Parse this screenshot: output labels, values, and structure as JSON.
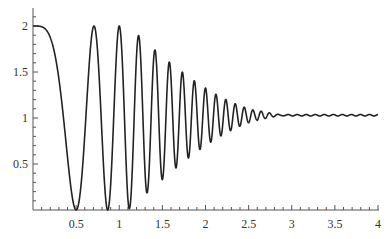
{
  "chart_data": {
    "type": "line",
    "title": "",
    "xlabel": "",
    "ylabel": "",
    "xlim": [
      0,
      4
    ],
    "ylim": [
      0,
      2.2
    ],
    "grid": false,
    "legend": null,
    "x_ticks": [
      0.5,
      1,
      1.5,
      2,
      2.5,
      3,
      3.5,
      4
    ],
    "x_tick_labels": [
      "0.5",
      "1",
      "1.5",
      "2",
      "2.5",
      "3",
      "3.5",
      "4"
    ],
    "y_ticks": [
      0.5,
      1,
      1.5,
      2
    ],
    "y_tick_labels": [
      "0.5",
      "1",
      "1.5",
      "2"
    ],
    "series": [
      {
        "name": "curve",
        "color": "#222222",
        "description": "1 + cos(4*pi*x^2) * envelope(x); envelope = 1 for x<=1.1, decaying smoothly to ~0 near x=3; settles near y=1.03",
        "params": {
          "freq": 12.566,
          "decay_start": 1.1,
          "decay_end": 3.0,
          "baseline": 1.0,
          "tail_offset": 0.03,
          "tail_ripple": 0.008
        },
        "key_points": [
          {
            "x": 0.0,
            "y": 2.0
          },
          {
            "x": 0.5,
            "y": 0.0
          },
          {
            "x": 0.707,
            "y": 2.0
          },
          {
            "x": 0.866,
            "y": 0.0
          },
          {
            "x": 1.0,
            "y": 2.0
          },
          {
            "x": 1.22,
            "y": 1.99
          },
          {
            "x": 1.41,
            "y": 1.92
          },
          {
            "x": 1.58,
            "y": 1.84
          },
          {
            "x": 1.72,
            "y": 1.73
          },
          {
            "x": 1.86,
            "y": 1.62
          },
          {
            "x": 1.99,
            "y": 1.52
          },
          {
            "x": 2.12,
            "y": 1.41
          },
          {
            "x": 2.23,
            "y": 1.33
          },
          {
            "x": 2.33,
            "y": 1.24
          },
          {
            "x": 2.44,
            "y": 1.16
          },
          {
            "x": 2.6,
            "y": 1.08
          },
          {
            "x": 2.8,
            "y": 1.04
          },
          {
            "x": 3.0,
            "y": 1.03
          },
          {
            "x": 4.0,
            "y": 1.03
          }
        ]
      }
    ]
  },
  "layout": {
    "origin_px": [
      33,
      210
    ],
    "px_per_x": 86.25,
    "px_per_y": 92,
    "y_axis_top_px": 8
  }
}
